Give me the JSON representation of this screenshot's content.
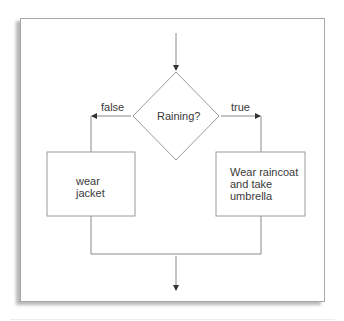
{
  "diagram": {
    "type": "flowchart",
    "start_arrow": true,
    "decision": {
      "label": "Raining?"
    },
    "branches": {
      "false": {
        "edge_label": "false",
        "action_lines": [
          "wear",
          "jacket"
        ]
      },
      "true": {
        "edge_label": "true",
        "action_lines": [
          "Wear raincoat",
          "and take",
          "umbrella"
        ]
      }
    },
    "merge_then_exit_arrow": true
  },
  "colors": {
    "line": "#8a8a8a",
    "text": "#3a3a3a",
    "frame_border": "#a8a8a8",
    "background": "#ffffff"
  }
}
